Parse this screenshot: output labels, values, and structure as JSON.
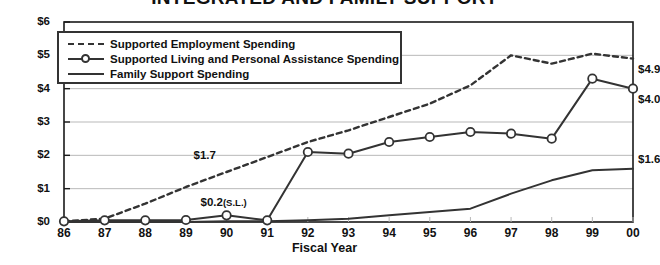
{
  "chart_data": {
    "type": "line",
    "title": "INTEGRATED AND FAMILY SUPPORT",
    "xlabel": "Fiscal Year",
    "ylabel": "",
    "grid": true,
    "legend_position": "top-left",
    "categories": [
      "86",
      "87",
      "88",
      "89",
      "90",
      "91",
      "92",
      "93",
      "94",
      "95",
      "96",
      "97",
      "98",
      "99",
      "00"
    ],
    "x": [
      "86",
      "87",
      "88",
      "89",
      "90",
      "91",
      "92",
      "93",
      "94",
      "95",
      "96",
      "97",
      "98",
      "99",
      "00"
    ],
    "xlim": [
      0,
      14
    ],
    "ylim": [
      0,
      6
    ],
    "y_ticks": [
      "$0",
      "$1",
      "$2",
      "$3",
      "$4",
      "$5",
      "$6"
    ],
    "y_tick_values": [
      0,
      1,
      2,
      3,
      4,
      5,
      6
    ],
    "series": [
      {
        "name": "Supported Employment Spending",
        "style": "dashed",
        "marker": "none",
        "values": [
          0.02,
          0.1,
          0.55,
          1.05,
          1.5,
          1.95,
          2.4,
          2.75,
          3.15,
          3.55,
          4.1,
          5.0,
          4.75,
          5.05,
          4.9
        ]
      },
      {
        "name": "Supported Living and Personal Assistance Spending",
        "style": "solid",
        "marker": "circle",
        "values": [
          0.02,
          0.05,
          0.05,
          0.06,
          0.2,
          0.05,
          2.1,
          2.05,
          2.4,
          2.55,
          2.7,
          2.65,
          2.5,
          4.3,
          4.0
        ]
      },
      {
        "name": "Family Support Spending",
        "style": "solid",
        "marker": "none",
        "values": [
          0.0,
          0.0,
          0.0,
          0.0,
          0.02,
          0.02,
          0.05,
          0.1,
          0.2,
          0.3,
          0.4,
          0.85,
          1.25,
          1.55,
          1.6
        ]
      }
    ],
    "annotations": [
      {
        "text": "$1.7",
        "x": "90",
        "y": 1.7,
        "series": "Supported Living and Personal Assistance Spending",
        "position": "above-left"
      },
      {
        "text": "$0.2",
        "sub": "(S.L.)",
        "x": "90",
        "y": 0.2,
        "series": "Supported Living and Personal Assistance Spending",
        "position": "above"
      },
      {
        "text": "$4.9",
        "x": "00",
        "y": 4.9,
        "series": "Supported Employment Spending",
        "position": "right-below"
      },
      {
        "text": "$4.0",
        "x": "00",
        "y": 4.0,
        "series": "Supported Living and Personal Assistance Spending",
        "position": "right-below"
      },
      {
        "text": "$1.6",
        "x": "00",
        "y": 1.6,
        "series": "Family Support Spending",
        "position": "right-above"
      }
    ]
  },
  "colors": {
    "line": "#333333",
    "grid": "#b9b9b9",
    "axis": "#1a1a1a",
    "background": "#ffffff",
    "marker_fill": "#ffffff"
  },
  "legend": {
    "items": [
      {
        "label": "Supported Employment Spending",
        "style": "dashed",
        "marker": "none"
      },
      {
        "label": "Supported Living and Personal Assistance Spending",
        "style": "solid",
        "marker": "circle"
      },
      {
        "label": "Family Support Spending",
        "style": "solid",
        "marker": "none"
      }
    ]
  }
}
